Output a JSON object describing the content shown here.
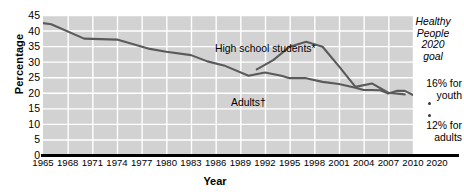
{
  "chart_data": {
    "type": "line",
    "title": "",
    "xlabel": "Year",
    "ylabel": "Percentage",
    "xlim": [
      1965,
      2010
    ],
    "ylim": [
      0,
      45
    ],
    "grid": true,
    "y_ticks": [
      45,
      40,
      35,
      30,
      25,
      20,
      15,
      10,
      5,
      0
    ],
    "x_ticks": [
      1965,
      1968,
      1971,
      1974,
      1977,
      1980,
      1983,
      1986,
      1989,
      1992,
      1995,
      1998,
      2001,
      2004,
      2007,
      2010
    ],
    "x_extra_tick": 2020,
    "legend_position": "inline-annotation",
    "series": [
      {
        "name": "Adults†",
        "label": "Adults†",
        "color": "#5a5a5a",
        "x": [
          1965,
          1966,
          1970,
          1974,
          1978,
          1980,
          1983,
          1985,
          1987,
          1990,
          1992,
          1994,
          1995,
          1997,
          1999,
          2001,
          2003,
          2004,
          2005,
          2006,
          2007,
          2008,
          2009,
          2010
        ],
        "y": [
          42.4,
          42.0,
          37.4,
          37.1,
          34.1,
          33.2,
          32.1,
          30.1,
          28.8,
          25.5,
          26.5,
          25.5,
          24.7,
          24.7,
          23.5,
          22.8,
          21.6,
          20.9,
          20.9,
          20.8,
          19.8,
          20.6,
          20.6,
          19.3
        ],
        "y_start": 42.4,
        "y_end": 19.3
      },
      {
        "name": "High school students*",
        "label": "High school students*",
        "color": "#5a5a5a",
        "x": [
          1991,
          1993,
          1995,
          1997,
          1999,
          2001,
          2003,
          2005,
          2007,
          2009
        ],
        "y": [
          27.5,
          30.5,
          34.8,
          36.4,
          34.8,
          28.5,
          21.9,
          23.0,
          20.0,
          19.5
        ],
        "y_start": 27.5,
        "y_end": 19.5
      }
    ],
    "annotations": [
      {
        "id": "high-school-note",
        "text": "High school students*",
        "x": 1988,
        "y": 39
      },
      {
        "id": "adults-note",
        "text": "Adults†",
        "x": 1990,
        "y": 21
      }
    ],
    "goal_panel": {
      "title_lines": [
        "Healthy",
        "People",
        "2020",
        "goal"
      ],
      "youth_lines": [
        "16% for",
        "youth"
      ],
      "adults_lines": [
        "12% for",
        "adults"
      ],
      "youth_value": 16,
      "adults_value": 12,
      "marker_count": 2
    },
    "colors": {
      "plot_background": "#d2d2d2",
      "gridline": "#ffffff",
      "line": "#5a5a5a",
      "axis": "#000000",
      "text": "#000000"
    }
  },
  "axes": {
    "y_title": "Percentage",
    "x_title": "Year",
    "y_tick_labels": [
      "45",
      "40",
      "35",
      "30",
      "25",
      "20",
      "15",
      "10",
      "5",
      "0"
    ],
    "x_tick_labels": [
      "1965",
      "1968",
      "1971",
      "1974",
      "1977",
      "1980",
      "1983",
      "1986",
      "1989",
      "1992",
      "1995",
      "1998",
      "2001",
      "2004",
      "2007",
      "2010",
      "2020"
    ]
  },
  "notes": {
    "high_school": "High school students*",
    "adults": "Adults†"
  },
  "goal": {
    "title": "Healthy\nPeople\n2020\ngoal",
    "title_l1": "Healthy",
    "title_l2": "People",
    "title_l3": "2020",
    "title_l4": "goal",
    "youth_l1": "16% for",
    "youth_l2": "youth",
    "adults_l1": "12% for",
    "adults_l2": "adults"
  }
}
